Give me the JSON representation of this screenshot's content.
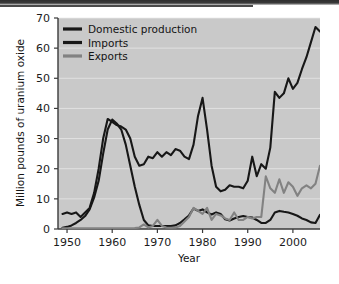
{
  "chart_data": {
    "type": "line",
    "title": "",
    "xlabel": "Year",
    "ylabel": "Million pounds of uranium oxide",
    "xlim": [
      1948,
      2006
    ],
    "ylim": [
      0,
      70
    ],
    "xticks": [
      1950,
      1960,
      1970,
      1980,
      1990,
      2000
    ],
    "yticks": [
      0,
      10,
      20,
      30,
      40,
      50,
      60,
      70
    ],
    "grid": "horizontal-white",
    "legend_position": "top-left-inside",
    "plot_background": "#c9c9c9",
    "series": [
      {
        "name": "Domestic production",
        "color": "#171717",
        "x": [
          1949,
          1950,
          1951,
          1952,
          1953,
          1954,
          1955,
          1956,
          1957,
          1958,
          1959,
          1960,
          1961,
          1962,
          1963,
          1964,
          1965,
          1966,
          1967,
          1968,
          1969,
          1970,
          1971,
          1972,
          1973,
          1974,
          1975,
          1976,
          1977,
          1978,
          1979,
          1980,
          1981,
          1982,
          1983,
          1984,
          1985,
          1986,
          1987,
          1988,
          1989,
          1990,
          1991,
          1992,
          1993,
          1994,
          1995,
          1996,
          1997,
          1998,
          1999,
          2000,
          2001,
          2002,
          2003,
          2004,
          2005,
          2006
        ],
        "values": [
          0.4,
          0.7,
          1.2,
          2.0,
          3.0,
          4.3,
          6.5,
          10.5,
          16.0,
          25.0,
          33.0,
          36.3,
          35.0,
          33.0,
          28.0,
          21.0,
          14.0,
          8.0,
          3.0,
          1.2,
          1.0,
          1.0,
          1.0,
          1.0,
          1.0,
          1.2,
          2.0,
          3.2,
          4.5,
          6.8,
          6.0,
          6.5,
          5.5,
          4.8,
          5.5,
          5.0,
          3.2,
          2.8,
          3.5,
          4.0,
          4.3,
          4.0,
          3.8,
          3.0,
          2.0,
          2.0,
          3.0,
          5.5,
          6.0,
          5.7,
          5.5,
          5.0,
          4.4,
          3.5,
          3.0,
          2.2,
          2.0,
          4.7
        ]
      },
      {
        "name": "Imports",
        "color": "#171717",
        "x": [
          1949,
          1950,
          1951,
          1952,
          1953,
          1954,
          1955,
          1956,
          1957,
          1958,
          1959,
          1960,
          1961,
          1962,
          1963,
          1964,
          1965,
          1966,
          1967,
          1968,
          1969,
          1970,
          1971,
          1972,
          1973,
          1974,
          1975,
          1976,
          1977,
          1978,
          1979,
          1980,
          1981,
          1982,
          1983,
          1984,
          1985,
          1986,
          1987,
          1988,
          1989,
          1990,
          1991,
          1992,
          1993,
          1994,
          1995,
          1996,
          1997,
          1998,
          1999,
          2000,
          2001,
          2002,
          2003,
          2004,
          2005,
          2006
        ],
        "values": [
          5.0,
          5.5,
          5.0,
          5.5,
          4.0,
          5.5,
          7.0,
          12.0,
          20.0,
          30.0,
          36.5,
          35.5,
          34.5,
          34.0,
          33.0,
          30.0,
          24.0,
          21.0,
          21.5,
          24.0,
          23.5,
          25.5,
          24.0,
          25.5,
          24.5,
          26.5,
          26.0,
          24.0,
          23.2,
          28.0,
          37.5,
          43.5,
          33.0,
          21.0,
          14.0,
          12.5,
          13.0,
          14.5,
          14.0,
          14.0,
          13.5,
          16.0,
          24.0,
          17.5,
          21.5,
          20.0,
          27.0,
          45.5,
          43.5,
          45.0,
          50.0,
          46.5,
          48.5,
          53.0,
          57.0,
          62.0,
          67.0,
          65.5
        ]
      },
      {
        "name": "Exports",
        "color": "#828282",
        "x": [
          1949,
          1960,
          1965,
          1966,
          1967,
          1968,
          1969,
          1970,
          1971,
          1972,
          1973,
          1974,
          1975,
          1976,
          1977,
          1978,
          1979,
          1980,
          1981,
          1982,
          1983,
          1984,
          1985,
          1986,
          1987,
          1988,
          1989,
          1990,
          1991,
          1992,
          1993,
          1994,
          1995,
          1996,
          1997,
          1998,
          1999,
          2000,
          2001,
          2002,
          2003,
          2004,
          2005,
          2006
        ],
        "values": [
          0.2,
          0.2,
          0.3,
          0.5,
          1.5,
          0.5,
          1.0,
          3.0,
          1.0,
          0.5,
          0.4,
          0.5,
          1.0,
          2.5,
          4.0,
          7.0,
          6.0,
          5.0,
          7.0,
          3.0,
          5.0,
          4.5,
          3.5,
          3.0,
          5.5,
          3.0,
          3.0,
          4.0,
          3.5,
          4.0,
          4.0,
          17.5,
          13.5,
          12.0,
          16.5,
          12.0,
          15.5,
          14.0,
          11.0,
          13.5,
          14.5,
          13.5,
          15.0,
          21.0
        ]
      }
    ],
    "legend": [
      {
        "label": "Domestic production",
        "color": "#171717"
      },
      {
        "label": "Imports",
        "color": "#171717"
      },
      {
        "label": "Exports",
        "color": "#828282"
      }
    ]
  }
}
